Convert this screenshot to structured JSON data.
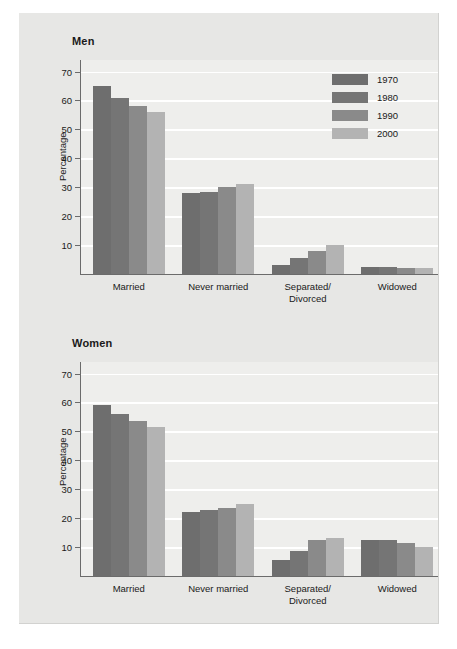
{
  "chart_data": [
    {
      "type": "bar",
      "title": "Men",
      "ylabel": "Percentage",
      "xlabel": "",
      "categories": [
        "Married",
        "Never married",
        "Separated/\nDivorced",
        "Widowed"
      ],
      "series": [
        {
          "name": "1970",
          "color": "#6e6e6e",
          "values": [
            65,
            28,
            3,
            2.5
          ]
        },
        {
          "name": "1980",
          "color": "#757575",
          "values": [
            61,
            28.5,
            5.5,
            2.5
          ]
        },
        {
          "name": "1990",
          "color": "#8a8a8a",
          "values": [
            58,
            30,
            8,
            2
          ]
        },
        {
          "name": "2000",
          "color": "#b3b3b3",
          "values": [
            56,
            31,
            10,
            2
          ]
        }
      ],
      "ylim": [
        0,
        74
      ],
      "yticks": [
        10,
        20,
        30,
        40,
        50,
        60,
        70
      ],
      "grid": true
    },
    {
      "type": "bar",
      "title": "Women",
      "ylabel": "Percentage",
      "xlabel": "",
      "categories": [
        "Married",
        "Never married",
        "Separated/\nDivorced",
        "Widowed"
      ],
      "series": [
        {
          "name": "1970",
          "color": "#6e6e6e",
          "values": [
            59,
            22,
            5.5,
            12.5
          ]
        },
        {
          "name": "1980",
          "color": "#757575",
          "values": [
            56,
            23,
            8.5,
            12.5
          ]
        },
        {
          "name": "1990",
          "color": "#8a8a8a",
          "values": [
            53.5,
            23.5,
            12.5,
            11.5
          ]
        },
        {
          "name": "2000",
          "color": "#b3b3b3",
          "values": [
            51.5,
            25,
            13,
            10
          ]
        }
      ],
      "ylim": [
        0,
        74
      ],
      "yticks": [
        10,
        20,
        30,
        40,
        50,
        60,
        70
      ],
      "grid": true
    }
  ],
  "legend": {
    "position": "top-right",
    "entries": [
      {
        "label": "1970",
        "color": "#6e6e6e"
      },
      {
        "label": "1980",
        "color": "#757575"
      },
      {
        "label": "1990",
        "color": "#8a8a8a"
      },
      {
        "label": "2000",
        "color": "#b3b3b3"
      }
    ]
  },
  "colors": {
    "panel_background": "#e7e7e5",
    "plot_background": "#eeeeec",
    "gridline": "#ffffff",
    "axis": "#6b6b6b",
    "text": "#1a1a1a"
  }
}
